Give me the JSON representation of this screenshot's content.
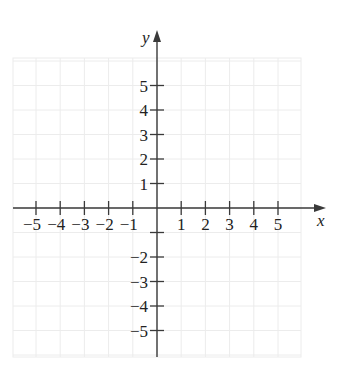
{
  "chart_data": {
    "type": "coordinate-plane",
    "title": "",
    "xlabel": "x",
    "ylabel": "y",
    "xlim": [
      -6,
      6
    ],
    "ylim": [
      -6,
      6
    ],
    "grid": true,
    "x_ticks": [
      -5,
      -4,
      -3,
      -2,
      -1,
      1,
      2,
      3,
      4,
      5
    ],
    "x_tick_labels": [
      "−5",
      "−4",
      "−3",
      "−2",
      "−1",
      "1",
      "2",
      "3",
      "4",
      "5"
    ],
    "y_ticks": [
      5,
      4,
      3,
      2,
      1,
      -1,
      -2,
      -3,
      -4,
      -5
    ],
    "y_tick_labels": [
      "5",
      "4",
      "3",
      "2",
      "1",
      "",
      "−2",
      "−3",
      "−4",
      "−5"
    ],
    "series": []
  },
  "axes": {
    "x_label": "x",
    "y_label": "y"
  },
  "colors": {
    "axis": "#3a3a3a",
    "grid": "#ececec",
    "text": "#222222",
    "background": "#ffffff"
  }
}
